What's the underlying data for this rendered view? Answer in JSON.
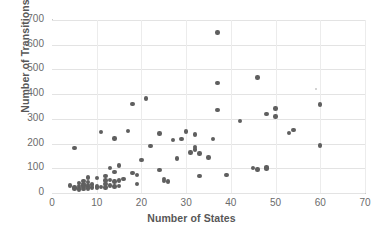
{
  "chart_data": {
    "type": "scatter",
    "title": "",
    "xlabel": "Number of States",
    "ylabel": "Number of Transitions",
    "xlim": [
      0,
      70
    ],
    "ylim": [
      0,
      700
    ],
    "xticks": [
      0,
      10,
      20,
      30,
      40,
      50,
      60,
      70
    ],
    "yticks": [
      0,
      100,
      200,
      300,
      400,
      500,
      600,
      700
    ],
    "grid": true,
    "legend": "none",
    "marker_color": "#5f5f5f",
    "gridline_color": "#e3e3e3",
    "background_color": "#ffffff",
    "series": [
      {
        "name": "states-vs-transitions",
        "points": [
          [
            4,
            30
          ],
          [
            5,
            182
          ],
          [
            5,
            22
          ],
          [
            5,
            18
          ],
          [
            6,
            40
          ],
          [
            6,
            28
          ],
          [
            6,
            20
          ],
          [
            6,
            14
          ],
          [
            7,
            48
          ],
          [
            7,
            36
          ],
          [
            7,
            30
          ],
          [
            7,
            24
          ],
          [
            7,
            16
          ],
          [
            8,
            62
          ],
          [
            8,
            44
          ],
          [
            8,
            32
          ],
          [
            8,
            26
          ],
          [
            8,
            18
          ],
          [
            9,
            34
          ],
          [
            9,
            22
          ],
          [
            10,
            60
          ],
          [
            10,
            26
          ],
          [
            10,
            20
          ],
          [
            11,
            247
          ],
          [
            11,
            24
          ],
          [
            12,
            68
          ],
          [
            12,
            50
          ],
          [
            12,
            36
          ],
          [
            12,
            22
          ],
          [
            13,
            100
          ],
          [
            13,
            52
          ],
          [
            13,
            30
          ],
          [
            14,
            220
          ],
          [
            14,
            86
          ],
          [
            14,
            46
          ],
          [
            14,
            26
          ],
          [
            15,
            112
          ],
          [
            15,
            50
          ],
          [
            15,
            28
          ],
          [
            16,
            56
          ],
          [
            17,
            252
          ],
          [
            18,
            360
          ],
          [
            18,
            80
          ],
          [
            19,
            74
          ],
          [
            19,
            36
          ],
          [
            20,
            134
          ],
          [
            21,
            383
          ],
          [
            22,
            189
          ],
          [
            24,
            240
          ],
          [
            24,
            93
          ],
          [
            25,
            57
          ],
          [
            25,
            49
          ],
          [
            26,
            47
          ],
          [
            27,
            215
          ],
          [
            28,
            140
          ],
          [
            29,
            219
          ],
          [
            30,
            249
          ],
          [
            31,
            164
          ],
          [
            32,
            186
          ],
          [
            32,
            176
          ],
          [
            32,
            236
          ],
          [
            33,
            160
          ],
          [
            33,
            69
          ],
          [
            35,
            144
          ],
          [
            36,
            219
          ],
          [
            37,
            650
          ],
          [
            37,
            445
          ],
          [
            37,
            337
          ],
          [
            39,
            72
          ],
          [
            42,
            291
          ],
          [
            45,
            100
          ],
          [
            46,
            467
          ],
          [
            46,
            95
          ],
          [
            48,
            320
          ],
          [
            48,
            103
          ],
          [
            48,
            99
          ],
          [
            50,
            342
          ],
          [
            50,
            310
          ],
          [
            53,
            242
          ],
          [
            54,
            255
          ],
          [
            60,
            358
          ],
          [
            60,
            192
          ]
        ]
      },
      {
        "name": "faint-outlier",
        "faint": true,
        "points": [
          [
            59,
            421
          ]
        ]
      }
    ]
  }
}
